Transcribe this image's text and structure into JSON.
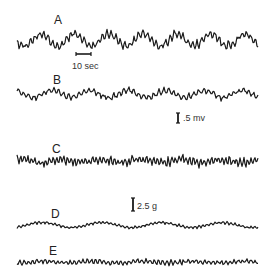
{
  "figure": {
    "traces": [
      {
        "label": "A",
        "label_pos": [
          54,
          14
        ],
        "baseline": 40,
        "amp_slow": 6,
        "amp_fast": 3.2,
        "slow_period": 34,
        "fast_period": 4.5,
        "seed": 1
      },
      {
        "label": "B",
        "label_pos": [
          53,
          74
        ],
        "baseline": 94,
        "amp_slow": 3.5,
        "amp_fast": 2.2,
        "slow_period": 38,
        "fast_period": 5,
        "seed": 2
      },
      {
        "label": "C",
        "label_pos": [
          52,
          143
        ],
        "baseline": 161,
        "amp_slow": 1.5,
        "amp_fast": 3.2,
        "slow_period": 40,
        "fast_period": 3.6,
        "seed": 3
      },
      {
        "label": "D",
        "label_pos": [
          51,
          208
        ],
        "baseline": 225,
        "amp_slow": 2.5,
        "amp_fast": 1.0,
        "slow_period": 60,
        "fast_period": 4,
        "seed": 4
      },
      {
        "label": "E",
        "label_pos": [
          49,
          245
        ],
        "baseline": 262,
        "amp_slow": 0.8,
        "amp_fast": 1.8,
        "slow_period": 50,
        "fast_period": 4.2,
        "seed": 5
      }
    ],
    "scale_bars": {
      "time": {
        "label": "10 sec",
        "x1": 76,
        "x2": 91,
        "y": 54,
        "label_pos": [
          72,
          62
        ]
      },
      "voltage": {
        "label": ".5 mv",
        "x": 178,
        "y1": 113,
        "y2": 123,
        "label_pos": [
          183,
          114
        ]
      },
      "force": {
        "label": "2.5 g",
        "x": 133,
        "y1": 198,
        "y2": 211,
        "label_pos": [
          137,
          202
        ]
      }
    },
    "x_start": 17,
    "x_end": 258,
    "trace_color": "#1a1a1a"
  }
}
